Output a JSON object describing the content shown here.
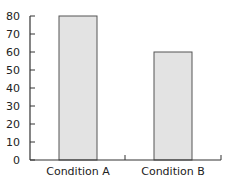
{
  "chart_data": {
    "type": "bar",
    "title": "",
    "xlabel": "",
    "ylabel": "",
    "categories": [
      "Condition A",
      "Condition B"
    ],
    "values": [
      80,
      60
    ],
    "ylim": [
      0,
      80
    ],
    "yticks": [
      "0",
      "10",
      "20",
      "30",
      "40",
      "50",
      "60",
      "70",
      "80"
    ],
    "grid": false,
    "legend": null,
    "bar_color": "#e3e3e3",
    "bar_edge_color": "#555555"
  }
}
